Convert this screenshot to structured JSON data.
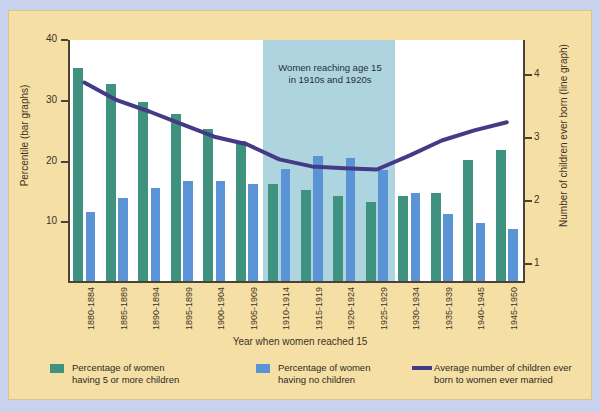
{
  "colors": {
    "page_background": "#c9d2ec",
    "panel_background": "#f6dfa4",
    "plot_background": "#ffffff",
    "highlight_band": "#aed4e0",
    "green_bar": "#3f9280",
    "blue_bar": "#5b94d6",
    "line": "#433b86",
    "axis": "#4a4234"
  },
  "annotation": {
    "line1": "Women reaching age 15",
    "line2": "in 1910s and 1920s"
  },
  "axes": {
    "left_title": "Percentile (bar graphs)",
    "right_title": "Number of children ever born (line graph)",
    "x_title": "Year when women reached 15",
    "left_ticks": [
      "10",
      "20",
      "30",
      "40"
    ],
    "right_ticks": [
      "1",
      "2",
      "3",
      "4"
    ]
  },
  "legend": {
    "items": [
      {
        "swatch": "green",
        "line1": "Percentage of women",
        "line2": "having 5 or more children"
      },
      {
        "swatch": "blue",
        "line1": "Percentage of women",
        "line2": "having no children"
      },
      {
        "swatch": "line",
        "line1": "Average number of children ever",
        "line2": "born to women ever married"
      }
    ]
  },
  "chart_data": {
    "type": "bar",
    "title": "",
    "xlabel": "Year when women reached 15",
    "ylabel": "Percentile (bar graphs)",
    "y2label": "Number of children ever born (line graph)",
    "ylim": [
      0,
      40
    ],
    "y2lim": [
      0,
      4.5
    ],
    "yticks": [
      10,
      20,
      30,
      40
    ],
    "y2ticks": [
      1,
      2,
      3,
      4
    ],
    "grid": false,
    "legend_position": "bottom",
    "categories": [
      "1880-1884",
      "1885-1889",
      "1890-1894",
      "1895-1899",
      "1900-1904",
      "1905-1909",
      "1910-1914",
      "1915-1919",
      "1920-1924",
      "1925-1929",
      "1930-1934",
      "1935-1939",
      "1940-1945",
      "1945-1950"
    ],
    "series": [
      {
        "name": "Percentage of women having 5 or more children",
        "type": "bar",
        "color": "#3f9280",
        "axis": "left",
        "values": [
          35.0,
          32.5,
          29.5,
          27.5,
          25.0,
          23.0,
          16.0,
          15.0,
          14.0,
          13.0,
          14.0,
          14.5,
          20.0,
          21.5
        ]
      },
      {
        "name": "Percentage of women having no children",
        "type": "bar",
        "color": "#5b94d6",
        "axis": "left",
        "values": [
          11.3,
          13.7,
          15.3,
          16.5,
          16.5,
          16.0,
          18.5,
          20.5,
          20.3,
          18.3,
          14.5,
          11.0,
          9.5,
          8.5
        ]
      },
      {
        "name": "Average number of children ever born to women ever married",
        "type": "line",
        "color": "#433b86",
        "axis": "right",
        "values": [
          3.88,
          3.6,
          3.42,
          3.22,
          3.02,
          2.9,
          2.66,
          2.55,
          2.52,
          2.5,
          2.72,
          2.96,
          3.12,
          3.25
        ]
      }
    ],
    "highlight_band": {
      "label": "Women reaching age 15 in 1910s and 1920s",
      "from_category": "1910-1914",
      "to_category": "1925-1929"
    }
  }
}
